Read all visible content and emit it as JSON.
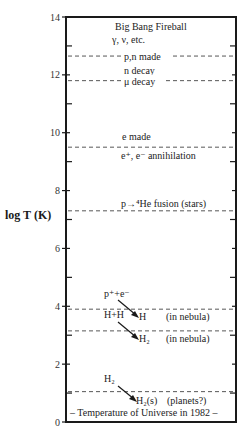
{
  "chart_data": {
    "type": "diagram",
    "ylabel": "log T (K)",
    "ylim": [
      0,
      14
    ],
    "y_ticks": [
      0,
      2,
      4,
      6,
      8,
      10,
      12,
      14
    ],
    "y_minor_ticks": [
      1,
      3,
      5,
      7,
      9,
      11,
      13
    ],
    "events": [
      {
        "name": "pn-made",
        "logT": 12.65,
        "label": "p,n made",
        "style": "inline"
      },
      {
        "name": "mu-decay",
        "logT": 11.8,
        "label": "μ decay",
        "style": "inline"
      },
      {
        "name": "e-annihilation",
        "logT": 9.5,
        "label_above": "e made",
        "label_below": "e⁺, e⁻ annihilation"
      },
      {
        "name": "fusion",
        "logT": 7.3,
        "label_above": "p→⁴He fusion (stars)"
      },
      {
        "name": "h-formation",
        "logT": 3.9,
        "reactant": "p⁺+e⁻",
        "product": "H",
        "note": "(in nebula)"
      },
      {
        "name": "h2-formation",
        "logT": 3.15,
        "reactant": "H+H",
        "product": "H₂",
        "note": "(in nebula)"
      },
      {
        "name": "h2-solid",
        "logT": 1.05,
        "reactant": "H₂",
        "product": "H₂(s)",
        "note": "(planets?)"
      }
    ],
    "header_labels": {
      "title": "Big Bang Fireball",
      "subtitle": "γ, ν, etc.",
      "n_decay": "n decay"
    },
    "footer_label": "– Temperature of Universe in 1982 –"
  }
}
